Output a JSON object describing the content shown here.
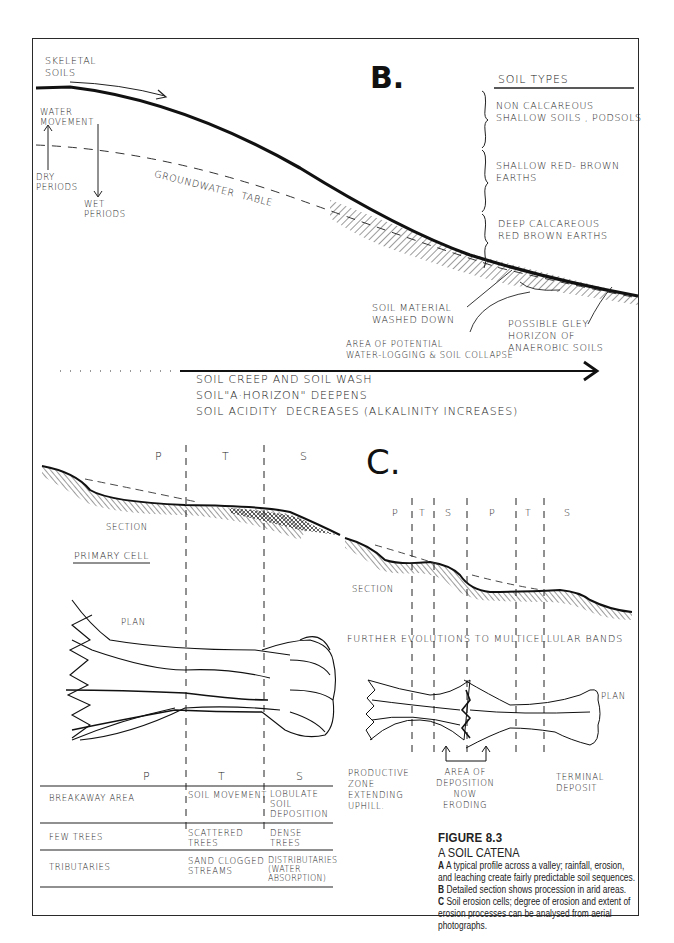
{
  "figure": {
    "number": "FIGURE 8.3",
    "title": "A SOIL CATENA",
    "captions": [
      {
        "key": "A",
        "text": "A typical profile across a valley; rainfall, erosion, and leaching create fairly predictable soil sequences."
      },
      {
        "key": "B",
        "text": "Detailed section shows procession in arid areas."
      },
      {
        "key": "C",
        "text": "Soil erosion cells; degree of erosion and extent of erosion processes can be analysed from aerial photographs."
      }
    ]
  },
  "panel_b": {
    "label": "B.",
    "skeletal_soils": "SKELETAL\nSOILS",
    "water_movement": "WATER\nMOVEMENT",
    "dry_periods": "DRY\nPERIODS",
    "wet_periods": "WET\nPERIODS",
    "groundwater": "GROUNDWATER  TABLE",
    "soil_types": {
      "heading": "SOIL TYPES",
      "items": [
        "NON CALCAREOUS\nSHALLOW SOILS , PODSOLS",
        "SHALLOW RED- BROWN\nEARTHS",
        "DEEP CALCAREOUS\nRED BROWN EARTHS"
      ]
    },
    "soil_material": "SOIL MATERIAL\nWASHED DOWN",
    "waterlogging": "AREA OF POTENTIAL\nWATER-LOGGING & SOIL COLLAPSE",
    "gley": "POSSIBLE GLEY\nHORIZON OF\nANAEROBIC SOILS",
    "trends": [
      "SOIL CREEP AND SOIL WASH",
      "SOIL\"A·HORIZON\" DEEPENS",
      "SOIL ACIDITY  DECREASES (ALKALINITY INCREASES)"
    ]
  },
  "panel_c": {
    "label": "C.",
    "primary": {
      "zones": [
        "P",
        "T",
        "S"
      ],
      "section": "SECTION",
      "title": "PRIMARY CELL",
      "plan": "PLAN"
    },
    "multi": {
      "zones": [
        "P",
        "T",
        "S",
        "P",
        "T",
        "S"
      ],
      "section": "SECTION",
      "title": "FURTHER EVOLUTIONS TO MULTICELLULAR BANDS",
      "plan": "PLAN",
      "productive": "PRODUCTIVE\nZONE\nEXTENDING\nUPHILL.",
      "deposition": "AREA OF\nDEPOSITION\nNOW\nERODING",
      "terminal": "TERMINAL\nDEPOSIT"
    },
    "table": {
      "headers": [
        "P",
        "T",
        "S"
      ],
      "rows": [
        [
          "BREAKAWAY AREA",
          "SOIL MOVEMENT",
          "LOBULATE\nSOIL\nDEPOSITION"
        ],
        [
          "FEW TREES",
          "SCATTERED\nTREES",
          "DENSE\nTREES"
        ],
        [
          "TRIBUTARIES",
          "SAND CLOGGED\nSTREAMS",
          "DISTRIBUTARIES\n(WATER\nABSORPTION)"
        ]
      ]
    }
  }
}
